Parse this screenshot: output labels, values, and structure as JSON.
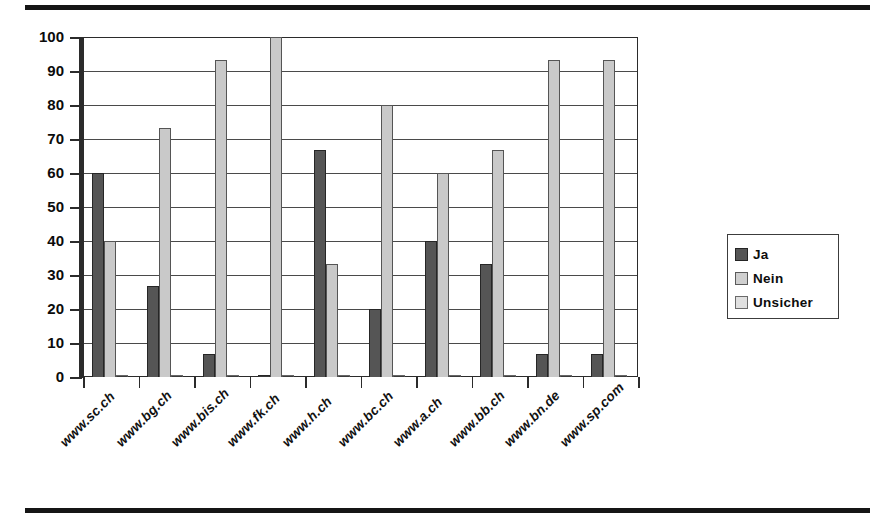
{
  "page": {
    "top_rule": "horizontal-rule",
    "bottom_rule": "horizontal-rule"
  },
  "chart_data": {
    "type": "bar",
    "title": "",
    "subtitle": "",
    "xlabel": "",
    "ylabel": "",
    "ylim": [
      0,
      100
    ],
    "ytick_step": 10,
    "yticks": [
      100,
      90,
      80,
      70,
      60,
      50,
      40,
      30,
      20,
      10,
      0
    ],
    "grid": true,
    "grid_axis": "y",
    "legend_position": "right",
    "bar_grouping": "grouped",
    "categories": [
      "www.sc.ch",
      "www.bg.ch",
      "www.bis.ch",
      "www.fk.ch",
      "www.h.ch",
      "www.bc.ch",
      "www.a.ch",
      "www.bb.ch",
      "www.bn.de",
      "www.sp.com"
    ],
    "series": [
      {
        "name": "Ja",
        "color": "#555555",
        "values": [
          60,
          26.7,
          6.7,
          0,
          66.7,
          20,
          40,
          33.3,
          6.7,
          6.7
        ]
      },
      {
        "name": "Nein",
        "color": "#c9c9c9",
        "values": [
          40,
          73.3,
          93.3,
          100,
          33.3,
          80,
          60,
          66.7,
          93.3,
          93.3
        ]
      },
      {
        "name": "Unsicher",
        "color": "#dcdcdc",
        "values": [
          0,
          0,
          0,
          0,
          0,
          0,
          0,
          0,
          0,
          0
        ]
      }
    ]
  },
  "legend": {
    "items": [
      {
        "label": "Ja"
      },
      {
        "label": "Nein"
      },
      {
        "label": "Unsicher"
      }
    ]
  }
}
